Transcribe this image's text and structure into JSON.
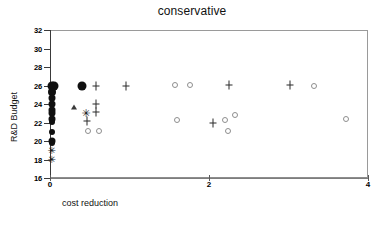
{
  "chart_data": {
    "type": "scatter",
    "title": "conservative",
    "xlabel": "cost reduction",
    "ylabel": "R&D Budget",
    "xlim": [
      0,
      4
    ],
    "ylim": [
      16,
      32
    ],
    "xticks": [
      0,
      2,
      4
    ],
    "xtick_labels": [
      "0",
      "2",
      "4"
    ],
    "yticks": [
      16,
      18,
      20,
      22,
      24,
      26,
      28,
      30,
      32
    ],
    "ytick_labels": [
      "16",
      "18",
      "20",
      "22",
      "24",
      "26",
      "28",
      "30",
      "32"
    ],
    "grid": false,
    "legend": "none",
    "marker_colors": {
      "filled_circle": "#101010",
      "open_circle": "#8e8e8e",
      "plus": "#2b2b2b",
      "faint_plus": "#9b9b9b",
      "star": "#151515",
      "triangle": "#3a3a3a"
    },
    "series": [
      {
        "name": "filled-circle",
        "marker": "filled_circle",
        "points": [
          {
            "x": 0.02,
            "y": 26.0,
            "size": 9
          },
          {
            "x": 0.05,
            "y": 25.9,
            "size": 9
          },
          {
            "x": 0.02,
            "y": 25.3,
            "size": 8
          },
          {
            "x": 0.02,
            "y": 24.6,
            "size": 7
          },
          {
            "x": 0.02,
            "y": 24.0,
            "size": 7
          },
          {
            "x": 0.02,
            "y": 23.4,
            "size": 7
          },
          {
            "x": 0.02,
            "y": 23.0,
            "size": 7
          },
          {
            "x": 0.02,
            "y": 22.4,
            "size": 7
          },
          {
            "x": 0.02,
            "y": 22.1,
            "size": 6
          },
          {
            "x": 0.02,
            "y": 21.0,
            "size": 6
          },
          {
            "x": 0.02,
            "y": 20.0,
            "size": 7
          },
          {
            "x": 0.02,
            "y": 19.8,
            "size": 6
          },
          {
            "x": 0.4,
            "y": 25.9,
            "size": 9
          }
        ]
      },
      {
        "name": "plus",
        "marker": "plus",
        "points": [
          {
            "x": 0.58,
            "y": 26.0,
            "size": 7
          },
          {
            "x": 0.95,
            "y": 26.0,
            "size": 7
          },
          {
            "x": 2.25,
            "y": 26.1,
            "size": 7
          },
          {
            "x": 3.02,
            "y": 26.1,
            "size": 7
          },
          {
            "x": 0.58,
            "y": 24.0,
            "size": 7
          },
          {
            "x": 0.58,
            "y": 23.1,
            "size": 7
          },
          {
            "x": 0.47,
            "y": 22.2,
            "size": 7
          },
          {
            "x": 2.05,
            "y": 21.9,
            "size": 7
          }
        ]
      },
      {
        "name": "star",
        "marker": "star",
        "points": [
          {
            "x": 0.45,
            "y": 23.0,
            "size": 11
          },
          {
            "x": 0.02,
            "y": 18.9,
            "size": 10
          },
          {
            "x": 0.02,
            "y": 18.0,
            "size": 10
          }
        ]
      },
      {
        "name": "triangle",
        "marker": "triangle",
        "points": [
          {
            "x": 0.3,
            "y": 23.7,
            "size": 6
          }
        ]
      },
      {
        "name": "open-circle",
        "marker": "open_circle",
        "points": [
          {
            "x": 1.57,
            "y": 26.1,
            "size": 4
          },
          {
            "x": 1.76,
            "y": 26.1,
            "size": 4
          },
          {
            "x": 3.32,
            "y": 26.0,
            "size": 4
          },
          {
            "x": 0.48,
            "y": 21.1,
            "size": 4
          },
          {
            "x": 0.62,
            "y": 21.1,
            "size": 4
          },
          {
            "x": 1.6,
            "y": 22.3,
            "size": 4
          },
          {
            "x": 2.2,
            "y": 22.3,
            "size": 4
          },
          {
            "x": 2.33,
            "y": 22.8,
            "size": 4
          },
          {
            "x": 2.24,
            "y": 21.1,
            "size": 4
          },
          {
            "x": 3.72,
            "y": 22.4,
            "size": 4
          }
        ]
      }
    ]
  }
}
